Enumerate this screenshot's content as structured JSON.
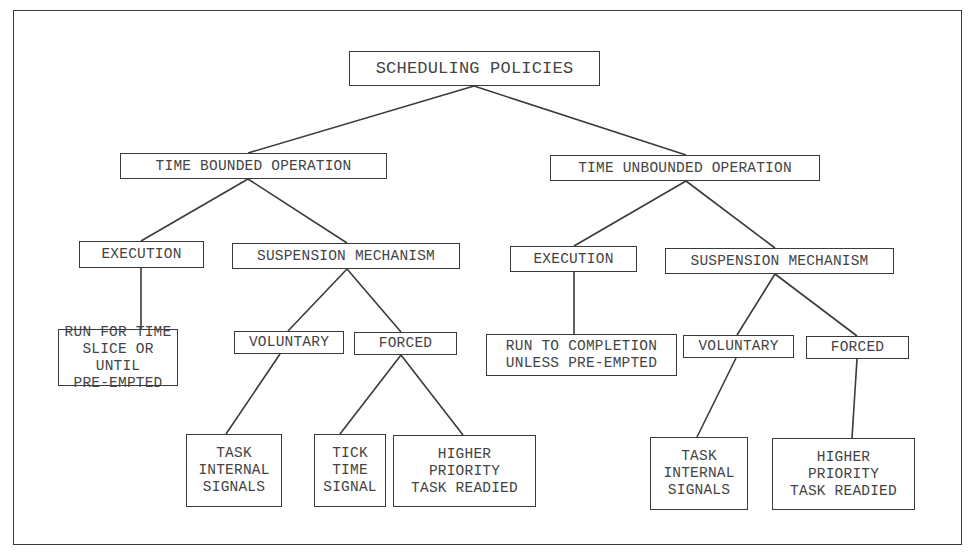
{
  "diagram": {
    "title": "SCHEDULING POLICIES",
    "nodes": {
      "root": {
        "label": "SCHEDULING POLICIES",
        "box": [
          349,
          51,
          251,
          35
        ]
      },
      "tbo": {
        "label": "TIME BOUNDED OPERATION",
        "box": [
          120,
          153,
          267,
          26
        ]
      },
      "tbo_exec": {
        "label": "EXECUTION",
        "box": [
          79,
          241,
          125,
          27
        ]
      },
      "tbo_susp": {
        "label": "SUSPENSION MECHANISM",
        "box": [
          232,
          243,
          228,
          26
        ]
      },
      "tbo_exec_leaf": {
        "label": "RUN FOR TIME\nSLICE OR UNTIL\nPRE-EMPTED",
        "box": [
          58,
          329,
          120,
          57
        ]
      },
      "tbo_vol": {
        "label": "VOLUNTARY",
        "box": [
          234,
          331,
          110,
          23
        ]
      },
      "tbo_forced": {
        "label": "FORCED",
        "box": [
          354,
          332,
          103,
          23
        ]
      },
      "tbo_vol_leaf": {
        "label": "TASK\nINTERNAL\nSIGNALS",
        "box": [
          186,
          434,
          96,
          73
        ]
      },
      "tbo_tick_leaf": {
        "label": "TICK\nTIME\nSIGNAL",
        "box": [
          314,
          434,
          72,
          73
        ]
      },
      "tbo_hp_leaf": {
        "label": "HIGHER\nPRIORITY\nTASK READIED",
        "box": [
          393,
          435,
          143,
          72
        ]
      },
      "tuo": {
        "label": "TIME UNBOUNDED OPERATION",
        "box": [
          550,
          155,
          270,
          26
        ]
      },
      "tuo_exec": {
        "label": "EXECUTION",
        "box": [
          510,
          246,
          127,
          26
        ]
      },
      "tuo_susp": {
        "label": "SUSPENSION MECHANISM",
        "box": [
          665,
          248,
          229,
          26
        ]
      },
      "tuo_exec_leaf": {
        "label": "RUN TO COMPLETION\nUNLESS PRE-EMPTED",
        "box": [
          486,
          334,
          191,
          42
        ]
      },
      "tuo_vol": {
        "label": "VOLUNTARY",
        "box": [
          683,
          335,
          111,
          23
        ]
      },
      "tuo_forced": {
        "label": "FORCED",
        "box": [
          806,
          336,
          103,
          23
        ]
      },
      "tuo_vol_leaf": {
        "label": "TASK\nINTERNAL\nSIGNALS",
        "box": [
          650,
          437,
          98,
          73
        ]
      },
      "tuo_hp_leaf": {
        "label": "HIGHER\nPRIORITY\nTASK READIED",
        "box": [
          772,
          438,
          143,
          72
        ]
      }
    },
    "edges": [
      {
        "from": [
          474,
          86
        ],
        "to": [
          248,
          153
        ]
      },
      {
        "from": [
          474,
          86
        ],
        "to": [
          686,
          155
        ]
      },
      {
        "from": [
          248,
          179
        ],
        "to": [
          141,
          241
        ]
      },
      {
        "from": [
          248,
          179
        ],
        "to": [
          347,
          243
        ]
      },
      {
        "from": [
          141,
          268
        ],
        "to": [
          141,
          329
        ]
      },
      {
        "from": [
          347,
          269
        ],
        "to": [
          288,
          331
        ]
      },
      {
        "from": [
          347,
          269
        ],
        "to": [
          401,
          332
        ]
      },
      {
        "from": [
          280,
          354
        ],
        "to": [
          226,
          434
        ]
      },
      {
        "from": [
          401,
          355
        ],
        "to": [
          340,
          434
        ]
      },
      {
        "from": [
          401,
          355
        ],
        "to": [
          463,
          435
        ]
      },
      {
        "from": [
          686,
          181
        ],
        "to": [
          574,
          246
        ]
      },
      {
        "from": [
          686,
          181
        ],
        "to": [
          775,
          248
        ]
      },
      {
        "from": [
          574,
          272
        ],
        "to": [
          574,
          334
        ]
      },
      {
        "from": [
          775,
          274
        ],
        "to": [
          737,
          335
        ]
      },
      {
        "from": [
          775,
          274
        ],
        "to": [
          857,
          336
        ]
      },
      {
        "from": [
          736,
          358
        ],
        "to": [
          697,
          437
        ]
      },
      {
        "from": [
          857,
          359
        ],
        "to": [
          852,
          438
        ]
      }
    ],
    "colors": {
      "line": "#3a3a3a",
      "background": "#ffffff",
      "text": "#444444"
    }
  }
}
